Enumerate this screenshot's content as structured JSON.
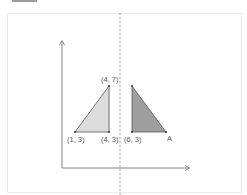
{
  "diagram": {
    "type": "coordinate-reflection",
    "mirror_line": "dashed vertical line",
    "left_triangle": {
      "fill": "#d9d9d9",
      "vertices": [
        {
          "label": "(1, 3)"
        },
        {
          "label": "(4, 3)"
        },
        {
          "label": "(4, 7)"
        }
      ]
    },
    "right_triangle": {
      "fill": "#9e9e9e",
      "vertices": [
        {
          "label": "(6, 3)"
        },
        {
          "label": "A"
        }
      ]
    },
    "colors": {
      "axis": "#777777",
      "outline": "#444444",
      "dashed_line": "#888888",
      "frame_border": "#ececec"
    }
  }
}
